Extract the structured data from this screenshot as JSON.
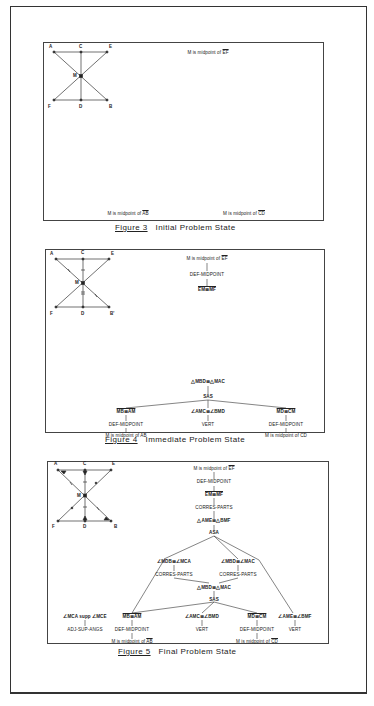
{
  "figures": [
    {
      "id": "figure-3",
      "number_label": "Figure 3",
      "title": "Initial Problem State",
      "geometry": {
        "points": [
          "A",
          "C",
          "E",
          "M",
          "F",
          "D",
          "B"
        ]
      },
      "statements": {
        "given_top": {
          "prefix": "M is midpoint of ",
          "segment": "EF"
        },
        "given_bottom_left": {
          "prefix": "M is midpoint of ",
          "segment": "AB"
        },
        "given_bottom_right": {
          "prefix": "M is midpoint of ",
          "segment": "CD"
        }
      }
    },
    {
      "id": "figure-4",
      "number_label": "Figure 4",
      "title": "Immediate Problem State",
      "geometry": {
        "points": [
          "A",
          "C",
          "E",
          "M",
          "F",
          "D",
          "B'"
        ]
      },
      "top_chain": {
        "given": {
          "prefix": "M is midpoint of ",
          "segment": "EF"
        },
        "rule": "DEF-MIDPOINT",
        "result": "EM≅MF"
      },
      "bottom_tree": {
        "goal": "△MBD≅△MAC",
        "rule": "SAS",
        "children": [
          {
            "statement": "MB≅AM",
            "rule": "DEF-MIDPOINT",
            "given": "M is midpoint of AB"
          },
          {
            "statement": "∠AMC≅∠BMD",
            "rule": "VERT"
          },
          {
            "statement": "MD≅CM",
            "rule": "DEF-MIDPOINT",
            "given": "M is midpoint of CD"
          }
        ]
      }
    },
    {
      "id": "figure-5",
      "number_label": "Figure 5",
      "title": "Final Problem State",
      "geometry": {
        "points": [
          "A",
          "C",
          "E",
          "M",
          "F",
          "D",
          "B"
        ]
      },
      "proof_tree": {
        "given": "M is midpoint of EF",
        "rule1": "DEF-MIDPOINT",
        "stmt1": "EM≅MF",
        "rule2": "CORRES-PARTS",
        "stmt2": "△AME≅△BMF",
        "rule3": "ASA",
        "mid_left": {
          "statement": "∠MDB≅∠MCA",
          "rule": "CORRES-PARTS"
        },
        "mid_right": {
          "statement": "∠MBD≅∠MAC",
          "rule": "CORRES-PARTS"
        },
        "congruence": "△MBD≅△MAC",
        "rule4": "SAS",
        "side_left": {
          "statement": "∠MCA supp ∠MCE",
          "rule": "ADJ-SUP-ANGS"
        },
        "leaves": [
          {
            "statement": "MB≅AM",
            "rule": "DEF-MIDPOINT",
            "given_prefix": "M is midpoint of ",
            "given_segment": "AB"
          },
          {
            "statement": "∠AMC≅∠BMD",
            "rule": "VERT"
          },
          {
            "statement": "MD≅CM",
            "rule": "DEF-MIDPOINT",
            "given_prefix": "M is midpoint of ",
            "given_segment": "CD"
          },
          {
            "statement": "∠AME≅∠BMF",
            "rule": "VERT"
          }
        ]
      }
    }
  ]
}
